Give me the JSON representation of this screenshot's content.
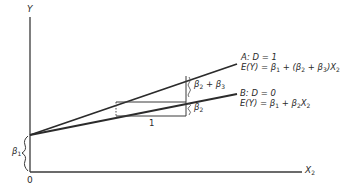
{
  "diagram": {
    "axes": {
      "y_label": "Y",
      "x_label": "X",
      "x_label_sub": "2",
      "origin_label": "0"
    },
    "intercept": {
      "label": "β",
      "label_sub": "1"
    },
    "lines": [
      {
        "id": "A",
        "title": "A: D = 1",
        "equation_prefix": "E(Y) = β",
        "equation_parts": [
          "1",
          " + (β",
          "2",
          " + β",
          "3",
          ")X",
          "2"
        ]
      },
      {
        "id": "B",
        "title": "B: D = 0",
        "equation_prefix": "E(Y) = β",
        "equation_parts": [
          "1",
          " + β",
          "2",
          "X",
          "2"
        ]
      }
    ],
    "slope_triangle": {
      "run_label": "1",
      "rise_A_label": "β",
      "rise_A_parts": [
        "2",
        " + β",
        "3"
      ],
      "rise_B_label": "β",
      "rise_B_sub": "2"
    },
    "colors": {
      "line": "#2b2b2b",
      "axis": "#3a3a3a",
      "text": "#2a2a2a"
    }
  }
}
